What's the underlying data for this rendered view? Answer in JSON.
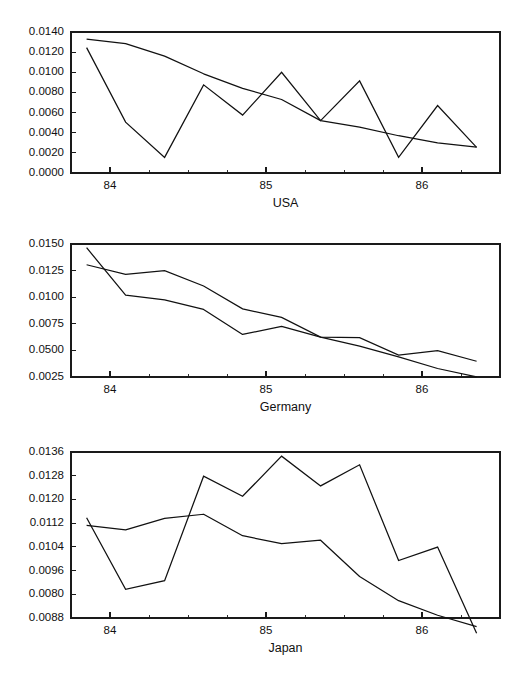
{
  "figure": {
    "background": "#ffffff",
    "line_color": "#111111",
    "panel_count": 3
  },
  "chart_data": [
    {
      "type": "line",
      "title": "USA",
      "xlabel": "USA",
      "ylabel": "",
      "grid": false,
      "legend": "none",
      "xlim": [
        1983.75,
        1986.5
      ],
      "ylim": [
        0.0,
        0.014
      ],
      "xticks": [
        1984,
        1985,
        1986
      ],
      "xtick_labels": [
        "84",
        "85",
        "86"
      ],
      "x_minor_tick_step": 0.25,
      "yticks": [
        0.0,
        0.002,
        0.004,
        0.006,
        0.008,
        0.01,
        0.012,
        0.014
      ],
      "ytick_labels": [
        "0.0000",
        "0.0020",
        "0.0040",
        "0.0060",
        "0.0080",
        "0.0100",
        "0.0120",
        "0.0140"
      ],
      "x": [
        1983.85,
        1984.1,
        1984.35,
        1984.6,
        1984.85,
        1985.1,
        1985.35,
        1985.6,
        1985.85,
        1986.1,
        1986.35
      ],
      "series": [
        {
          "name": "actual",
          "style": "zigzag",
          "values": [
            0.01245,
            0.00505,
            0.00155,
            0.00875,
            0.00575,
            0.01,
            0.0052,
            0.00915,
            0.00155,
            0.0067,
            0.00255
          ]
        },
        {
          "name": "fitted",
          "style": "smooth",
          "values": [
            0.0133,
            0.01285,
            0.0116,
            0.00985,
            0.0084,
            0.0073,
            0.0052,
            0.00455,
            0.0037,
            0.003,
            0.00258
          ]
        }
      ]
    },
    {
      "type": "line",
      "title": "Germany",
      "xlabel": "Germany",
      "ylabel": "",
      "grid": false,
      "legend": "none",
      "xlim": [
        1983.75,
        1986.5
      ],
      "ylim": [
        0.0025,
        0.015
      ],
      "xticks": [
        1984,
        1985,
        1986
      ],
      "xtick_labels": [
        "84",
        "85",
        "86"
      ],
      "x_minor_tick_step": 0.25,
      "yticks": [
        0.0025,
        0.005,
        0.0075,
        0.01,
        0.0125,
        0.015
      ],
      "ytick_labels": [
        "0.0025",
        "0.0500",
        "0.0075",
        "0.0100",
        "0.0125",
        "0.0150"
      ],
      "ytick_label_note": "printed as shown; the 0.0050 tick is rendered 0.0500 in the source image",
      "x": [
        1983.85,
        1984.1,
        1984.35,
        1984.6,
        1984.85,
        1985.1,
        1985.35,
        1985.6,
        1985.85,
        1986.1,
        1986.35
      ],
      "series": [
        {
          "name": "actual",
          "style": "jagged",
          "values": [
            0.01305,
            0.01215,
            0.0125,
            0.01105,
            0.0089,
            0.0081,
            0.00625,
            0.0062,
            0.00455,
            0.00498,
            0.00398
          ]
        },
        {
          "name": "fitted",
          "style": "smooth",
          "values": [
            0.01465,
            0.0102,
            0.00975,
            0.00885,
            0.0065,
            0.00725,
            0.00625,
            0.0054,
            0.0044,
            0.0033,
            0.00252
          ]
        }
      ]
    },
    {
      "type": "line",
      "title": "Japan",
      "xlabel": "Japan",
      "ylabel": "",
      "grid": false,
      "legend": "none",
      "xlim": [
        1983.75,
        1986.5
      ],
      "ylim": [
        0.0088,
        0.0136
      ],
      "xticks": [
        1984,
        1985,
        1986
      ],
      "xtick_labels": [
        "84",
        "85",
        "86"
      ],
      "x_minor_tick_step": 0.25,
      "yticks": [
        0.0088,
        0.0096,
        0.0104,
        0.0112,
        0.012,
        0.0128,
        0.0136
      ],
      "ytick_labels": [
        "0.0088",
        "0.0080",
        "0.0096",
        "0.0104",
        "0.0112",
        "0.0120",
        "0.0128",
        "0.0136"
      ],
      "ytick_label_note": "printed as shown; the lowest two labels read 0.0080 above 0.0088 in the source image",
      "x": [
        1983.85,
        1984.1,
        1984.35,
        1984.6,
        1984.85,
        1985.1,
        1985.35,
        1985.6,
        1985.85,
        1986.1,
        1986.35
      ],
      "series": [
        {
          "name": "actual",
          "style": "jagged",
          "values": [
            0.0117,
            0.00963,
            0.00988,
            0.0129,
            0.01232,
            0.01348,
            0.01262,
            0.01323,
            0.01046,
            0.01085,
            0.00836
          ]
        },
        {
          "name": "fitted",
          "style": "smooth",
          "values": [
            0.01148,
            0.01135,
            0.01168,
            0.0118,
            0.01118,
            0.01095,
            0.01105,
            0.01,
            0.0093,
            0.00888,
            0.00855
          ]
        }
      ]
    }
  ]
}
